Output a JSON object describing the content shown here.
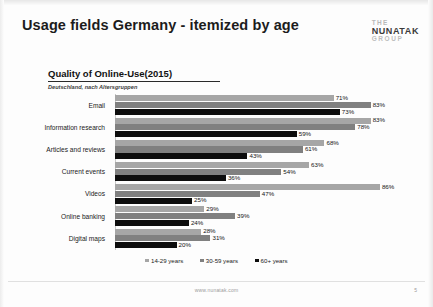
{
  "slide": {
    "title": "Usage fields Germany - itemized by age",
    "footer_url": "www.nunatak.com",
    "page_number": "5"
  },
  "logo": {
    "line1": "THE",
    "line2": "NUNATAK",
    "line3": "GROUP"
  },
  "chart_data": {
    "type": "bar",
    "orientation": "horizontal",
    "title": "Quality of Online-Use(2015)",
    "subtitle": "Deutschland, nach Altersgruppen",
    "xlabel": "",
    "ylabel": "",
    "xlim": [
      0,
      100
    ],
    "grid": false,
    "legend_position": "bottom",
    "value_suffix": "%",
    "categories": [
      "Email",
      "Information research",
      "Articles and reviews",
      "Current events",
      "Videos",
      "Online banking",
      "Digital maps"
    ],
    "series": [
      {
        "name": "14-29 years",
        "color": "#a6a6a6",
        "values": [
          71,
          83,
          68,
          63,
          86,
          29,
          28
        ],
        "labels": [
          "71%",
          "83%",
          "68%",
          "63%",
          "86%",
          "29%",
          "28%"
        ]
      },
      {
        "name": "30-59 years",
        "color": "#808080",
        "values": [
          83,
          78,
          61,
          54,
          47,
          39,
          31
        ],
        "labels": [
          "83%",
          "78%",
          "61%",
          "54%",
          "47%",
          "39%",
          "31%"
        ]
      },
      {
        "name": "60+ years",
        "color": "#0d0d0d",
        "values": [
          73,
          59,
          43,
          36,
          25,
          24,
          20
        ],
        "labels": [
          "73%",
          "59%",
          "43%",
          "36%",
          "25%",
          "24%",
          "20%"
        ]
      }
    ]
  }
}
